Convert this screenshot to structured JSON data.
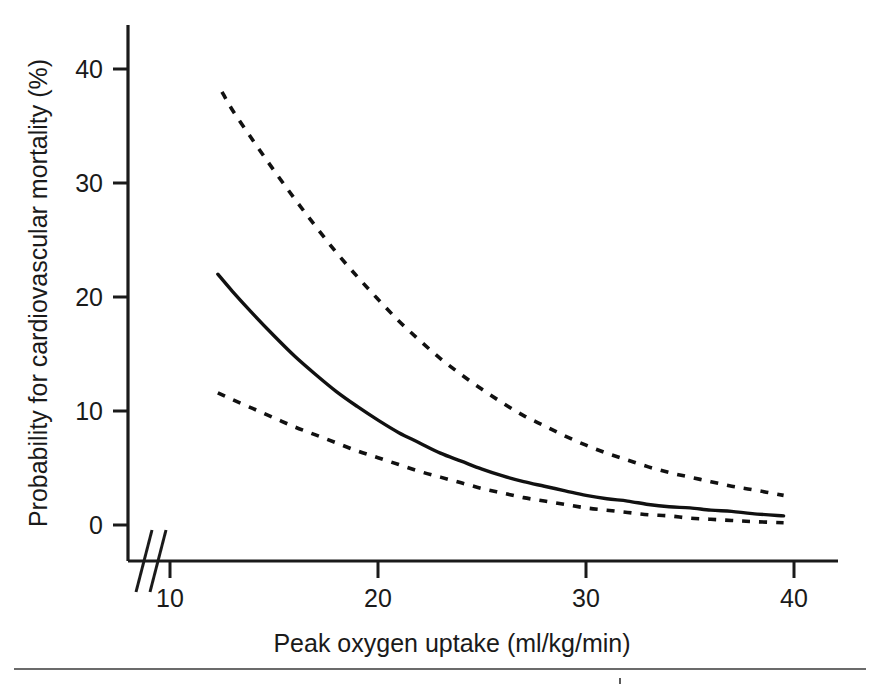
{
  "figure": {
    "background_color": "#ffffff",
    "ink_color": "#111111"
  },
  "axes": {
    "y_title": "Probability for cardiovascular mortality (%)",
    "x_title": "Peak oxygen uptake (ml/kg/min)",
    "y_ticks": [
      "0",
      "10",
      "20",
      "30",
      "40"
    ],
    "x_ticks": [
      "10",
      "20",
      "30",
      "40"
    ],
    "break_symbol": "//"
  },
  "chart_data": {
    "type": "line",
    "title": "",
    "subtitle": "",
    "xlabel": "Peak oxygen uptake (ml/kg/min)",
    "ylabel": "Probability for cardiovascular mortality (%)",
    "xlim": [
      8,
      42
    ],
    "ylim": [
      0,
      44
    ],
    "x_tick_values": [
      10,
      20,
      30,
      40
    ],
    "y_tick_values": [
      0,
      10,
      20,
      30,
      40
    ],
    "grid": false,
    "legend": "none",
    "axis_break": {
      "axis": "x",
      "symbol": "//",
      "between": [
        8.0,
        9.6
      ]
    },
    "annotations": [],
    "series": [
      {
        "name": "Estimated probability",
        "style": "solid",
        "x": [
          12.3,
          13.0,
          14.0,
          15.0,
          16.0,
          17.0,
          18.0,
          19.0,
          20.0,
          21.0,
          22.0,
          23.0,
          24.0,
          25.0,
          26.0,
          27.0,
          28.0,
          29.0,
          30.0,
          31.0,
          32.0,
          33.0,
          34.0,
          35.0,
          36.0,
          37.0,
          38.0,
          39.5
        ],
        "y": [
          22.0,
          20.5,
          18.5,
          16.6,
          14.8,
          13.2,
          11.7,
          10.4,
          9.2,
          8.1,
          7.2,
          6.3,
          5.6,
          4.9,
          4.3,
          3.8,
          3.4,
          3.0,
          2.6,
          2.3,
          2.1,
          1.8,
          1.6,
          1.5,
          1.3,
          1.2,
          1.0,
          0.8
        ]
      },
      {
        "name": "Upper 95% confidence limit",
        "style": "dashed",
        "x": [
          12.5,
          13.0,
          14.0,
          15.0,
          16.0,
          17.0,
          18.0,
          19.0,
          20.0,
          21.0,
          22.0,
          23.0,
          24.0,
          25.0,
          26.0,
          27.0,
          28.0,
          29.0,
          30.0,
          31.0,
          32.0,
          33.0,
          34.0,
          35.0,
          36.0,
          37.0,
          38.0,
          39.5
        ],
        "y": [
          38.0,
          36.4,
          33.7,
          31.1,
          28.6,
          26.2,
          23.9,
          21.8,
          19.8,
          17.9,
          16.2,
          14.6,
          13.2,
          11.9,
          10.7,
          9.6,
          8.7,
          7.8,
          7.0,
          6.3,
          5.7,
          5.1,
          4.6,
          4.2,
          3.8,
          3.4,
          3.1,
          2.6
        ]
      },
      {
        "name": "Lower 95% confidence limit",
        "style": "dashed",
        "x": [
          12.3,
          13.0,
          14.0,
          15.0,
          16.0,
          17.0,
          18.0,
          19.0,
          20.0,
          21.0,
          22.0,
          23.0,
          24.0,
          25.0,
          26.0,
          27.0,
          28.0,
          29.0,
          30.0,
          31.0,
          32.0,
          33.0,
          34.0,
          35.0,
          36.0,
          37.0,
          38.0,
          39.5
        ],
        "y": [
          11.6,
          11.0,
          10.2,
          9.4,
          8.6,
          7.9,
          7.2,
          6.5,
          5.9,
          5.3,
          4.7,
          4.2,
          3.7,
          3.2,
          2.8,
          2.4,
          2.1,
          1.8,
          1.5,
          1.3,
          1.1,
          0.9,
          0.8,
          0.6,
          0.5,
          0.4,
          0.3,
          0.2
        ]
      }
    ]
  }
}
